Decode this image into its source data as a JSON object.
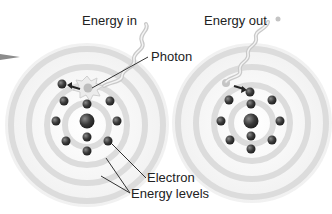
{
  "diagram": {
    "labels": {
      "energy_in": "Energy in",
      "energy_out": "Energy out",
      "photon": "Photon",
      "electron": "Electron",
      "energy_levels": "Energy levels"
    },
    "atoms": [
      {
        "name": "absorbing-atom",
        "center": [
          87,
          122
        ],
        "rings": 4,
        "electrons": 10
      },
      {
        "name": "emitting-atom",
        "center": [
          252,
          122
        ],
        "rings": 4,
        "electrons": 10
      }
    ],
    "colors": {
      "ring": "#d9d9d9",
      "electron": "#3a3a3a",
      "nucleus": "#444444",
      "photon_wave": "#cccccc",
      "leader_line": "#333333",
      "arrow": "#999999"
    }
  }
}
